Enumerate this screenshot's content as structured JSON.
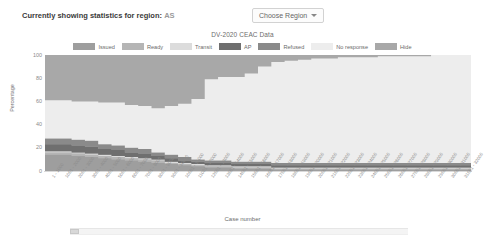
{
  "header": {
    "region_label": "Currently showing statistics for region:",
    "region_value": "AS",
    "choose_region_button": "Choose Region"
  },
  "chart_data": {
    "type": "area",
    "title": "DV-2020 CEAC Data",
    "xlabel": "Case number",
    "ylabel": "Percentage",
    "ylim": [
      0,
      100
    ],
    "yticks": [
      0,
      20,
      40,
      60,
      80,
      100
    ],
    "grid": false,
    "legend_position": "top",
    "stacked": true,
    "stack_order": [
      "Issued",
      "Ready",
      "Transit",
      "AP",
      "Refused",
      "No response"
    ],
    "colors": {
      "Issued": "#9e9e9e",
      "Ready": "#b5b5b5",
      "Transit": "#dcdcdc",
      "AP": "#6f6f6f",
      "Refused": "#8a8a8a",
      "No response": "#ededed",
      "Hide": "#a8a8a8"
    },
    "legend": [
      {
        "label": "Issued",
        "color": "#9e9e9e"
      },
      {
        "label": "Ready",
        "color": "#b5b5b5"
      },
      {
        "label": "Transit",
        "color": "#dcdcdc"
      },
      {
        "label": "AP",
        "color": "#6f6f6f"
      },
      {
        "label": "Refused",
        "color": "#8a8a8a"
      },
      {
        "label": "No response",
        "color": "#ededed"
      },
      {
        "label": "Hide",
        "color": "#a8a8a8"
      }
    ],
    "categories": [
      "1 - 1000",
      "1001 - 2000",
      "2001 - 3000",
      "3001 - 4000",
      "4001 - 5000",
      "5001 - 6000",
      "6001 - 7000",
      "7001 - 8000",
      "8001 - 9000",
      "9001 - 10000",
      "10001 - 11000",
      "11001 - 12000",
      "12001 - 13000",
      "13001 - 14000",
      "14001 - 15000",
      "15001 - 16000",
      "16001 - 17000",
      "17001 - 18000",
      "18001 - 19000",
      "19001 - 20000",
      "20001 - 21000",
      "21001 - 22000",
      "22001 - 23000",
      "23001 - 24000",
      "24001 - 25000",
      "25001 - 26000",
      "26001 - 27000",
      "27001 - 28000",
      "28001 - 29000",
      "29001 - 30000",
      "30001 - 31000",
      "31001 - 32000"
    ],
    "series": [
      {
        "name": "Issued",
        "values": [
          14,
          14,
          13,
          12,
          11,
          10,
          9,
          8,
          7,
          6,
          5,
          4,
          3,
          3,
          2,
          2,
          2,
          1,
          1,
          1,
          1,
          1,
          1,
          1,
          1,
          1,
          1,
          1,
          1,
          1,
          1,
          1
        ]
      },
      {
        "name": "Ready",
        "values": [
          2,
          2,
          2,
          2,
          2,
          2,
          2,
          2,
          2,
          1,
          1,
          1,
          1,
          1,
          1,
          1,
          1,
          1,
          1,
          1,
          1,
          1,
          1,
          1,
          1,
          1,
          1,
          1,
          1,
          1,
          1,
          1
        ]
      },
      {
        "name": "Transit",
        "values": [
          1,
          1,
          1,
          1,
          1,
          1,
          1,
          1,
          1,
          1,
          1,
          1,
          1,
          1,
          1,
          1,
          1,
          1,
          1,
          1,
          1,
          1,
          1,
          1,
          1,
          1,
          1,
          1,
          1,
          1,
          1,
          1
        ]
      },
      {
        "name": "AP",
        "values": [
          6,
          6,
          6,
          6,
          5,
          5,
          4,
          4,
          3,
          3,
          2,
          2,
          2,
          2,
          2,
          2,
          2,
          2,
          2,
          2,
          2,
          2,
          2,
          2,
          2,
          2,
          2,
          2,
          2,
          2,
          2,
          2
        ]
      },
      {
        "name": "Refused",
        "values": [
          5,
          5,
          5,
          5,
          4,
          4,
          4,
          4,
          3,
          3,
          3,
          2,
          2,
          2,
          2,
          2,
          2,
          2,
          2,
          2,
          2,
          2,
          2,
          2,
          2,
          2,
          2,
          2,
          2,
          2,
          2,
          2
        ]
      },
      {
        "name": "No response",
        "values": [
          33,
          33,
          33,
          34,
          36,
          37,
          37,
          37,
          38,
          42,
          46,
          52,
          70,
          72,
          73,
          76,
          82,
          87,
          88,
          89,
          90,
          90,
          91,
          91,
          91,
          92,
          92,
          92,
          92,
          93,
          93,
          93
        ]
      }
    ]
  }
}
